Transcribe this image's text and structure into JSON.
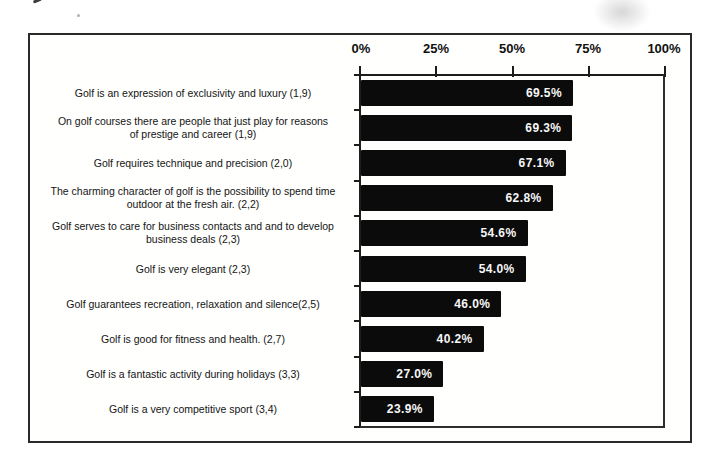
{
  "chart_data": {
    "type": "bar",
    "orientation": "horizontal",
    "title": "",
    "xlabel": "",
    "ylabel": "",
    "xlim": [
      0,
      100
    ],
    "grid": false,
    "legend": null,
    "axis": {
      "position": "top",
      "ticks": [
        "0%",
        "25%",
        "50%",
        "75%",
        "100%"
      ],
      "tick_values": [
        0,
        25,
        50,
        75,
        100
      ]
    },
    "categories": [
      "Golf is an expression of exclusivity and luxury (1,9)",
      "On golf courses there are people that just play for reasons of prestige and career (1,9)",
      "Golf requires technique and precision (2,0)",
      "The charming character of golf is the possibility to spend time outdoor at the fresh air. (2,2)",
      "Golf serves to care for business contacts and and to develop business deals (2,3)",
      "Golf is very elegant (2,3)",
      "Golf guarantees recreation, relaxation and silence(2,5)",
      "Golf is good for fitness and health. (2,7)",
      "Golf is a fantastic activity during holidays (3,3)",
      "Golf is a very competitive sport (3,4)"
    ],
    "category_lines": [
      [
        "Golf is an expression of exclusivity and luxury (1,9)"
      ],
      [
        "On golf courses there are people that just play for reasons",
        "of prestige and career (1,9)"
      ],
      [
        "Golf requires technique and precision (2,0)"
      ],
      [
        "The charming character of golf is the possibility to spend time",
        "outdoor at the fresh air. (2,2)"
      ],
      [
        "Golf serves to care for business contacts and and to develop",
        "business deals (2,3)"
      ],
      [
        "Golf is very elegant (2,3)"
      ],
      [
        "Golf guarantees recreation, relaxation and silence(2,5)"
      ],
      [
        "Golf is good for fitness and health. (2,7)"
      ],
      [
        "Golf is a fantastic activity during holidays (3,3)"
      ],
      [
        "Golf is a very competitive sport (3,4)"
      ]
    ],
    "values": [
      69.5,
      69.3,
      67.1,
      62.8,
      54.6,
      54.0,
      46.0,
      40.2,
      27.0,
      23.9
    ],
    "value_labels": [
      "69.5%",
      "69.3%",
      "67.1%",
      "62.8%",
      "54.6%",
      "54.0%",
      "46.0%",
      "40.2%",
      "27.0%",
      "23.9%"
    ],
    "bar_color": "#0b0b0b",
    "value_label_color": "#f7f7f7",
    "axis_color": "#1c1c1c"
  }
}
